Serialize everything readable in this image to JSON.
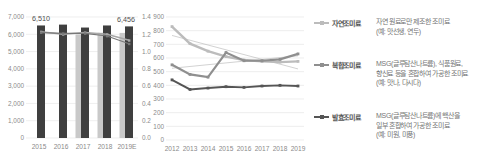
{
  "accent_colors": {
    "bar_dark": "#3f3f3f",
    "bar_light": "#c9c9c9",
    "grid": "#e7e7e7",
    "axis_text": "#8a8a8a"
  },
  "chart_data": [
    {
      "id": "seasoning-retail-market-size",
      "type": "bar",
      "categories": [
        "2015",
        "2016",
        "2017",
        "2018",
        "2019E"
      ],
      "y_left": {
        "min": 0,
        "max": 7000,
        "step": 1000,
        "tick_labels": [
          "0",
          "1,000",
          "2,000",
          "3,000",
          "4,000",
          "5,000",
          "6,000",
          "7,000"
        ]
      },
      "y_right": {
        "min": 0,
        "max": 1.4,
        "step": 0.2,
        "tick_labels": [
          "0.0",
          "0.2",
          "0.4",
          "0.6",
          "0.8",
          "1.0",
          "1.2",
          "1.4"
        ]
      },
      "series": [
        {
          "name": "bar-secondary",
          "type": "bar",
          "axis": "left",
          "color": "#c9c9c9",
          "values": [
            null,
            null,
            5990,
            6090,
            6080
          ]
        },
        {
          "name": "bar-primary",
          "type": "bar",
          "axis": "left",
          "color": "#3f3f3f",
          "values": [
            6510,
            6560,
            6390,
            6510,
            6456
          ]
        },
        {
          "name": "ratio-line-light",
          "type": "line",
          "axis": "right",
          "color": "#a8a8a8",
          "width": 1.6,
          "values": [
            1.23,
            1.2,
            1.22,
            1.2,
            1.13
          ]
        },
        {
          "name": "ratio-line-dark",
          "type": "line",
          "axis": "right",
          "color": "#787878",
          "width": 1.2,
          "values": [
            1.22,
            1.21,
            1.21,
            1.18,
            1.09
          ]
        }
      ],
      "point_labels": [
        {
          "index": 0,
          "text": "6,510",
          "anchor": "middle"
        },
        {
          "index": 4,
          "text": "6,456",
          "anchor": "end"
        }
      ]
    },
    {
      "id": "seasoning-segment-trend",
      "type": "line",
      "categories": [
        "2012",
        "2013",
        "2014",
        "2015",
        "2016",
        "2017",
        "2018",
        "2019"
      ],
      "y": {
        "min": 0,
        "max": 900,
        "step": 100,
        "tick_labels": [
          "0",
          "100",
          "200",
          "300",
          "400",
          "500",
          "600",
          "700",
          "800",
          "900"
        ]
      },
      "series": [
        {
          "name": "trend-down",
          "color": "#b4b4b4",
          "width": 0.6,
          "marker": false,
          "values": [
            765,
            730,
            695,
            660,
            625,
            590,
            555,
            520
          ]
        },
        {
          "name": "trend-up",
          "color": "#b4b4b4",
          "width": 0.6,
          "marker": false,
          "values": [
            525,
            538,
            551,
            564,
            577,
            590,
            603,
            616
          ]
        },
        {
          "name": "자연조미료",
          "color": "#bcbcbc",
          "width": 2.4,
          "marker": true,
          "values": [
            830,
            705,
            650,
            610,
            585,
            575,
            570,
            575
          ]
        },
        {
          "name": "복합조미료",
          "color": "#8f8f8f",
          "width": 2.2,
          "marker": true,
          "values": [
            550,
            480,
            460,
            640,
            580,
            580,
            590,
            630
          ]
        },
        {
          "name": "발효조미료",
          "color": "#555555",
          "width": 1.9,
          "marker": true,
          "values": [
            440,
            370,
            380,
            390,
            385,
            395,
            400,
            395
          ]
        }
      ]
    }
  ],
  "legend": {
    "entries": [
      {
        "name": "자연조미료",
        "color": "#bcbcbc",
        "desc": "자연 원료로만 제조한 조미료\n(예: 맛선생, 연두)"
      },
      {
        "name": "복합조미료",
        "color": "#8f8f8f",
        "desc": "MSG(글루탐산나트륨), 식품원료,\n향신료 등을 혼합하여 가공한 조미료\n(예: 맛나, 다시다)"
      },
      {
        "name": "발효조미료",
        "color": "#555555",
        "desc": "MSG(글루탐산나트륨)에 핵산을\n일부 혼합하여 가공한 조미료\n(예: 미원, 미풍)"
      }
    ]
  }
}
